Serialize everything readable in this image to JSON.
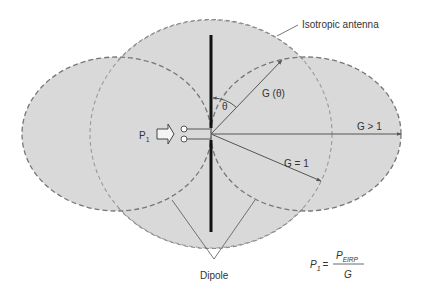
{
  "diagram": {
    "colors": {
      "fill": "#d9d9d9",
      "dash_dark": "#767676",
      "dash_light": "#9a9a9a",
      "line": "#555555",
      "rod": "#111111",
      "text": "#333333",
      "background": "#ffffff"
    },
    "labels": {
      "isotropic": "Isotropic antenna",
      "gain_theta": "G (θ)",
      "theta": "θ",
      "gain_gt1": "G > 1",
      "gain_eq1": "G = 1",
      "input_power": "P",
      "input_power_sub": "1",
      "dipole": "Dipole"
    },
    "formula": {
      "lhs": "P",
      "lhs_sub": "1",
      "equals": "=",
      "numerator": "P",
      "numerator_sub": "EIRP",
      "denominator": "G"
    },
    "shapes": {
      "isotropic_circle": {
        "cx": 211,
        "cy": 134,
        "rx": 121,
        "ry": 114
      },
      "left_lobe": {
        "cx": 116.5,
        "cy": 134,
        "rx": 94.5,
        "ry": 77
      },
      "right_lobe": {
        "cx": 306,
        "cy": 134,
        "rx": 95,
        "ry": 77
      },
      "feed_point": {
        "x": 211,
        "y": 134
      },
      "rod": {
        "x": 211,
        "y1": 35,
        "y2": 232
      }
    },
    "vectors": [
      {
        "name": "G(theta)",
        "to": [
          282,
          60
        ]
      },
      {
        "name": "G>1",
        "to": [
          401,
          134
        ]
      },
      {
        "name": "G=1",
        "to": [
          321,
          181
        ]
      }
    ]
  }
}
